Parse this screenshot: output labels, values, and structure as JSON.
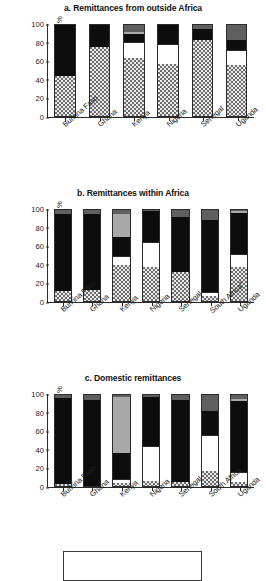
{
  "figure": {
    "y_axis_label": "use of channel, %",
    "y_ticks": [
      "100",
      "80",
      "60",
      "40",
      "20",
      "0"
    ]
  },
  "panels": [
    {
      "id": "a",
      "title": "a. Remittances from outside Africa"
    },
    {
      "id": "b",
      "title": "b. Remittances within Africa"
    },
    {
      "id": "c",
      "title": "c. Domestic remittances"
    }
  ],
  "chart_data": [
    {
      "type": "bar",
      "stacked": true,
      "title": "a. Remittances from outside Africa",
      "xlabel": "",
      "ylabel": "use of channel, %",
      "ylim": [
        0,
        100
      ],
      "yticks": [
        0,
        20,
        40,
        60,
        80,
        100
      ],
      "grid": false,
      "legend": "bottom-box",
      "categories": [
        "Burkina Faso",
        "Ghana",
        "Kenya",
        "Nigeria",
        "Senegal",
        "Uganda"
      ],
      "series": [
        {
          "name": "dotted-channel",
          "pattern": "dotted",
          "color": "#e9e9e9",
          "values": [
            44,
            76,
            64,
            57,
            83,
            56
          ]
        },
        {
          "name": "white-channel",
          "pattern": "white",
          "color": "#ffffff",
          "values": [
            0,
            0,
            17,
            22,
            0,
            17
          ]
        },
        {
          "name": "black-channel",
          "pattern": "black",
          "color": "#0d0d0d",
          "values": [
            56,
            24,
            9,
            21,
            13,
            10
          ]
        },
        {
          "name": "light-gray-channel",
          "pattern": "light-gray",
          "color": "#a9a9a9",
          "values": [
            0,
            0,
            2,
            0,
            0,
            0
          ]
        },
        {
          "name": "dark-gray-channel",
          "pattern": "dark-gray",
          "color": "#5f5f5f",
          "values": [
            0,
            0,
            8,
            0,
            4,
            17
          ]
        }
      ]
    },
    {
      "type": "bar",
      "stacked": true,
      "title": "b. Remittances within Africa",
      "xlabel": "",
      "ylabel": "use of channel, %",
      "ylim": [
        0,
        100
      ],
      "yticks": [
        0,
        20,
        40,
        60,
        80,
        100
      ],
      "grid": false,
      "legend": "bottom-box",
      "categories": [
        "Burkina Faso",
        "Ghana",
        "Kenya",
        "Nigeria",
        "Senegal",
        "South Africaᵃ",
        "Uganda"
      ],
      "series": [
        {
          "name": "dotted-channel",
          "pattern": "dotted",
          "color": "#e9e9e9",
          "values": [
            11,
            12,
            40,
            37,
            32,
            5,
            37
          ]
        },
        {
          "name": "white-channel",
          "pattern": "white",
          "color": "#ffffff",
          "values": [
            0,
            0,
            10,
            28,
            0,
            5,
            15
          ]
        },
        {
          "name": "black-channel",
          "pattern": "black",
          "color": "#0d0d0d",
          "values": [
            85,
            84,
            20,
            34,
            60,
            79,
            45
          ]
        },
        {
          "name": "light-gray-channel",
          "pattern": "light-gray",
          "color": "#a9a9a9",
          "values": [
            0,
            0,
            26,
            0,
            0,
            0,
            2
          ]
        },
        {
          "name": "dark-gray-channel",
          "pattern": "dark-gray",
          "color": "#5f5f5f",
          "values": [
            4,
            4,
            4,
            1,
            8,
            11,
            1
          ]
        }
      ]
    },
    {
      "type": "bar",
      "stacked": true,
      "title": "c. Domestic remittances",
      "xlabel": "",
      "ylabel": "use of channel, %",
      "ylim": [
        0,
        100
      ],
      "yticks": [
        0,
        20,
        40,
        60,
        80,
        100
      ],
      "grid": false,
      "legend": "bottom-box",
      "categories": [
        "Burkina Faso",
        "Ghana",
        "Kenya",
        "Nigeria",
        "Senegal",
        "South Africa",
        "Uganda"
      ],
      "series": [
        {
          "name": "dotted-channel",
          "pattern": "dotted",
          "color": "#e9e9e9",
          "values": [
            2,
            0,
            3,
            6,
            4,
            16,
            4
          ]
        },
        {
          "name": "white-channel",
          "pattern": "white",
          "color": "#ffffff",
          "values": [
            0,
            0,
            5,
            38,
            0,
            40,
            11
          ]
        },
        {
          "name": "black-channel",
          "pattern": "black",
          "color": "#0d0d0d",
          "values": [
            95,
            95,
            28,
            54,
            91,
            26,
            78
          ]
        },
        {
          "name": "light-gray-channel",
          "pattern": "light-gray",
          "color": "#a9a9a9",
          "values": [
            0,
            0,
            62,
            0,
            0,
            0,
            3
          ]
        },
        {
          "name": "dark-gray-channel",
          "pattern": "dark-gray",
          "color": "#5f5f5f",
          "values": [
            3,
            5,
            2,
            2,
            5,
            18,
            4
          ]
        }
      ]
    }
  ]
}
